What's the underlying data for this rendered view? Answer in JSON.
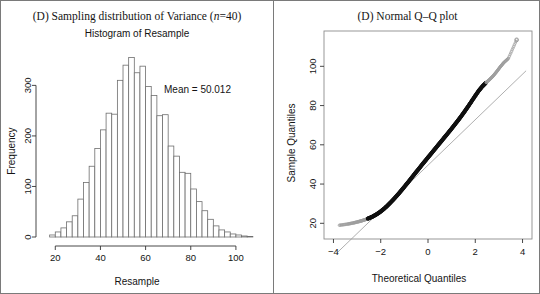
{
  "figure": {
    "background": "#ffffff",
    "border_color": "#7a7a7a"
  },
  "left_panel": {
    "panel_label": "(D) Sampling distribution of Variance (",
    "panel_label_italic": "n",
    "panel_label_tail": "=40)",
    "subtitle": "Histogram of Resample",
    "annotation": "Mean = 50.012"
  },
  "right_panel": {
    "panel_label": "(D) Normal Q–Q plot"
  },
  "chart_data": [
    {
      "type": "bar",
      "title": "Histogram of Resample",
      "panel": "(D) Sampling distribution of Variance (n=40)",
      "xlabel": "Resample",
      "ylabel": "Frequency",
      "xlim": [
        15,
        112
      ],
      "ylim": [
        0,
        372
      ],
      "xticks": [
        20,
        40,
        60,
        80,
        100
      ],
      "yticks": [
        0,
        100,
        200,
        300
      ],
      "grid": false,
      "annotations": [
        {
          "text": "Mean = 50.012",
          "x": 72,
          "y": 318
        }
      ],
      "bin_width": 2.5,
      "bar_fill": "#ffffff",
      "bar_edge": "#6e6e6e",
      "categories": [
        18.75,
        21.25,
        23.75,
        26.25,
        28.75,
        31.25,
        33.75,
        36.25,
        38.75,
        41.25,
        43.75,
        46.25,
        48.75,
        51.25,
        53.75,
        56.25,
        58.75,
        61.25,
        63.75,
        66.25,
        68.75,
        71.25,
        73.75,
        76.25,
        78.75,
        81.25,
        83.75,
        86.25,
        88.75,
        91.25,
        93.75,
        96.25,
        98.75,
        101.25,
        103.75,
        106.25
      ],
      "values": [
        4,
        10,
        18,
        30,
        42,
        75,
        108,
        140,
        175,
        212,
        245,
        243,
        310,
        340,
        355,
        325,
        338,
        298,
        280,
        240,
        242,
        180,
        160,
        128,
        126,
        95,
        70,
        52,
        35,
        22,
        14,
        10,
        6,
        4,
        2,
        1
      ]
    },
    {
      "type": "scatter",
      "title": "(D) Normal Q–Q plot",
      "xlabel": "Theoretical Quantiles",
      "ylabel": "Sample Quantiles",
      "xlim": [
        -4.4,
        4.4
      ],
      "ylim": [
        12,
        118
      ],
      "xticks": [
        -4,
        -2,
        0,
        2,
        4
      ],
      "yticks": [
        20,
        40,
        60,
        80,
        100
      ],
      "grid": false,
      "point_color": "#111111",
      "reference_line": {
        "slope": 11.6,
        "intercept": 49.6,
        "color": "#9a9a9a"
      },
      "description": "Right-skewed: points bow above the reference line at both extremes",
      "x": [
        -3.75,
        -3.4,
        -3.15,
        -2.95,
        -2.8,
        -2.65,
        -2.5,
        -2.35,
        -2.2,
        -2.05,
        -1.9,
        -1.75,
        -1.6,
        -1.45,
        -1.3,
        -1.15,
        -1.0,
        -0.85,
        -0.7,
        -0.55,
        -0.4,
        -0.25,
        -0.1,
        0.05,
        0.2,
        0.35,
        0.5,
        0.65,
        0.8,
        0.95,
        1.1,
        1.25,
        1.4,
        1.55,
        1.7,
        1.85,
        2.0,
        2.15,
        2.3,
        2.45,
        2.6,
        2.75,
        2.9,
        3.05,
        3.2,
        3.4,
        3.75
      ],
      "y": [
        19.0,
        19.6,
        20.2,
        20.8,
        21.3,
        21.9,
        22.6,
        23.4,
        24.4,
        25.6,
        27.0,
        28.6,
        30.4,
        32.3,
        34.3,
        36.4,
        38.6,
        40.8,
        43.1,
        45.4,
        47.6,
        49.9,
        52.1,
        54.3,
        56.5,
        58.7,
        60.9,
        63.1,
        65.3,
        67.5,
        69.8,
        72.1,
        74.5,
        77.0,
        79.6,
        82.3,
        85.0,
        87.6,
        89.8,
        91.6,
        93.2,
        95.0,
        97.2,
        99.6,
        101.8,
        104.0,
        113.5
      ],
      "outlier": {
        "x": 3.75,
        "y": 113.5
      }
    }
  ]
}
